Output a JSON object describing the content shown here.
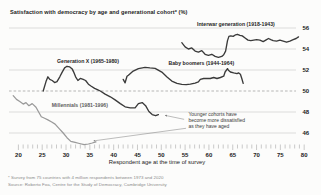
{
  "title": "Satisfaction with democracy by age and generational cohort* (%)",
  "footnotes": [
    "* Survey from 75 countries with 4 million respondents between 1973 and 2020",
    "Source: Roberto Foa, Centre for the Study of Democracy, Cambridge University"
  ],
  "colors": {
    "grid": "#cfcfcf",
    "reference_dash": "#a5a5a5",
    "tick": "#9f9f9f",
    "axis_text": "#1d1d1d",
    "label_text": "#1f1f1f",
    "annotation_text": "#3a3a3a",
    "arrow": "#7a7a7a",
    "dark_line": "#3a3a3a",
    "light_line": "#9a9a9a"
  },
  "chart_data": {
    "type": "line",
    "title": "Satisfaction with democracy by age and generational cohort* (%)",
    "xlabel": "Respondent age at the time of survey",
    "ylabel": "",
    "xlim": [
      18,
      81
    ],
    "ylim": [
      44,
      57
    ],
    "yticks": [
      46,
      48,
      50,
      52,
      54,
      56
    ],
    "xticks_major": [
      20,
      25,
      30,
      35,
      40,
      45,
      50,
      55,
      60,
      65,
      70,
      75,
      80
    ],
    "xtick_minor_step": 1,
    "reference_line": 50,
    "grid": "horizontal",
    "legend_position": "inline-labels",
    "series": [
      {
        "id": "millennials",
        "name": "Millennials (1981-1996)",
        "color": "#9a9a9a",
        "width": 1.25,
        "label_xy": [
          27,
          48.45
        ],
        "label_color": "#5f5f5f",
        "points": [
          [
            18.9,
            49.55
          ],
          [
            19.6,
            49.2
          ],
          [
            20.3,
            49.0
          ],
          [
            21.0,
            48.75
          ],
          [
            21.6,
            48.9
          ],
          [
            22.2,
            48.6
          ],
          [
            22.9,
            48.8
          ],
          [
            23.7,
            48.45
          ],
          [
            24.8,
            47.55
          ],
          [
            25.5,
            47.4
          ],
          [
            26.2,
            47.25
          ],
          [
            27.0,
            47.05
          ],
          [
            27.7,
            46.85
          ],
          [
            28.6,
            46.4
          ],
          [
            29.4,
            46.0
          ],
          [
            30.2,
            45.55
          ],
          [
            31.0,
            45.2
          ],
          [
            31.9,
            45.1
          ],
          [
            32.8,
            45.0
          ],
          [
            33.8,
            44.9
          ],
          [
            34.7,
            44.95
          ],
          [
            35.5,
            45.05
          ],
          [
            36.3,
            45.15
          ]
        ]
      },
      {
        "id": "generation-x",
        "name": "Generation X (1965-1980)",
        "color": "#3a3a3a",
        "width": 1.35,
        "label_xy": [
          28.1,
          52.7
        ],
        "label_color": "#1f1f1f",
        "points": [
          [
            25.2,
            50.0
          ],
          [
            25.8,
            50.9
          ],
          [
            26.2,
            51.35
          ],
          [
            26.6,
            51.1
          ],
          [
            27.1,
            51.0
          ],
          [
            27.6,
            50.8
          ],
          [
            28.1,
            50.9
          ],
          [
            28.7,
            51.35
          ],
          [
            29.2,
            51.8
          ],
          [
            29.7,
            52.2
          ],
          [
            30.2,
            52.35
          ],
          [
            30.8,
            52.3
          ],
          [
            31.3,
            52.1
          ],
          [
            31.6,
            51.8
          ],
          [
            32.0,
            51.35
          ],
          [
            32.5,
            51.0
          ],
          [
            33.0,
            51.2
          ],
          [
            33.6,
            51.1
          ],
          [
            34.1,
            51.0
          ],
          [
            34.7,
            50.65
          ],
          [
            35.3,
            50.45
          ],
          [
            36.0,
            50.25
          ],
          [
            36.7,
            50.1
          ],
          [
            37.2,
            50.0
          ],
          [
            38.2,
            49.7
          ],
          [
            39.3,
            49.45
          ],
          [
            40.3,
            49.15
          ],
          [
            41.4,
            48.8
          ],
          [
            42.4,
            48.5
          ],
          [
            43.5,
            48.4
          ],
          [
            44.5,
            48.4
          ],
          [
            45.2,
            48.8
          ],
          [
            46.0,
            48.9
          ],
          [
            46.7,
            48.6
          ],
          [
            47.4,
            48.05
          ],
          [
            48.1,
            47.75
          ],
          [
            48.8,
            47.65
          ],
          [
            49.4,
            47.75
          ]
        ]
      },
      {
        "id": "baby-boomers",
        "name": "Baby boomers (1944-1964)",
        "color": "#3a3a3a",
        "width": 1.35,
        "label_xy": [
          51.5,
          52.45
        ],
        "label_color": "#1f1f1f",
        "points": [
          [
            42.0,
            51.1
          ],
          [
            42.4,
            50.78
          ],
          [
            42.8,
            51.4
          ],
          [
            43.1,
            51.5
          ],
          [
            44.1,
            51.9
          ],
          [
            45.2,
            52.13
          ],
          [
            46.6,
            52.25
          ],
          [
            47.6,
            52.2
          ],
          [
            48.7,
            52.16
          ],
          [
            50.1,
            51.8
          ],
          [
            51.2,
            51.34
          ],
          [
            52.2,
            50.94
          ],
          [
            53.3,
            50.72
          ],
          [
            54.3,
            50.63
          ],
          [
            55.2,
            50.6
          ],
          [
            56.1,
            50.66
          ],
          [
            57.1,
            50.75
          ],
          [
            57.8,
            50.87
          ],
          [
            58.2,
            51.1
          ],
          [
            58.9,
            51.19
          ],
          [
            60.3,
            51.19
          ],
          [
            61.0,
            51.29
          ],
          [
            61.7,
            51.19
          ],
          [
            62.4,
            51.29
          ],
          [
            63.1,
            51.41
          ],
          [
            63.4,
            51.81
          ],
          [
            63.9,
            52.13
          ],
          [
            64.1,
            51.97
          ],
          [
            64.5,
            51.81
          ],
          [
            65.2,
            51.72
          ],
          [
            65.9,
            51.66
          ],
          [
            66.2,
            51.72
          ],
          [
            66.6,
            51.6
          ],
          [
            66.9,
            51.19
          ],
          [
            67.2,
            50.72
          ]
        ]
      },
      {
        "id": "interwar",
        "name": "Interwar generation (1918-1943)",
        "color": "#3a3a3a",
        "width": 1.35,
        "label_xy": [
          57.5,
          56.15
        ],
        "label_color": "#1f1f1f",
        "points": [
          [
            54.3,
            54.6
          ],
          [
            55.0,
            54.2
          ],
          [
            55.7,
            54.0
          ],
          [
            56.4,
            54.1
          ],
          [
            57.1,
            53.8
          ],
          [
            57.8,
            53.7
          ],
          [
            58.5,
            53.85
          ],
          [
            59.2,
            53.5
          ],
          [
            59.9,
            53.4
          ],
          [
            60.6,
            53.5
          ],
          [
            61.3,
            53.3
          ],
          [
            62.0,
            53.2
          ],
          [
            62.7,
            53.3
          ],
          [
            63.1,
            53.45
          ],
          [
            63.5,
            53.8
          ],
          [
            63.9,
            54.8
          ],
          [
            64.2,
            55.2
          ],
          [
            64.6,
            55.25
          ],
          [
            65.1,
            55.2
          ],
          [
            65.6,
            55.35
          ],
          [
            66.0,
            55.4
          ],
          [
            66.5,
            55.3
          ],
          [
            67.0,
            55.25
          ],
          [
            67.6,
            55.05
          ],
          [
            68.2,
            54.85
          ],
          [
            68.8,
            54.8
          ],
          [
            69.4,
            54.85
          ],
          [
            70.0,
            54.9
          ],
          [
            70.7,
            54.85
          ],
          [
            71.4,
            54.7
          ],
          [
            72.1,
            54.9
          ],
          [
            72.5,
            55.0
          ],
          [
            73.0,
            54.9
          ],
          [
            73.5,
            54.8
          ],
          [
            74.2,
            54.75
          ],
          [
            74.9,
            54.85
          ],
          [
            75.6,
            54.75
          ],
          [
            76.3,
            54.65
          ],
          [
            77.0,
            54.75
          ],
          [
            77.7,
            54.9
          ],
          [
            78.3,
            55.0
          ],
          [
            78.8,
            55.15
          ]
        ]
      }
    ],
    "annotation": {
      "lines": [
        "Younger cohorts have",
        "become more dissatisfied",
        "as they have aged"
      ],
      "xy": [
        55.7,
        47.65
      ],
      "arrows": [
        {
          "from": [
            54.8,
            47.3
          ],
          "to": [
            50.8,
            47.68
          ]
        },
        {
          "from": [
            55.2,
            46.45
          ],
          "to": [
            35.8,
            45.25
          ]
        }
      ]
    }
  }
}
